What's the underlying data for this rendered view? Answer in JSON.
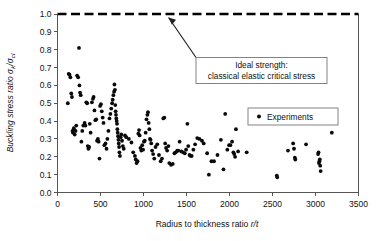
{
  "chart_data": {
    "type": "scatter",
    "title": "",
    "xlabel": "Radius to thickness ratio r/t",
    "ylabel": "Buckling stress ratio σk/σcl",
    "ylabel_parts": {
      "main": "Buckling stress ratio ",
      "sym1": "σ",
      "sub1": "k",
      "slash": "/",
      "sym2": "σ",
      "sub2": "cl"
    },
    "xlim": [
      0,
      3500
    ],
    "ylim": [
      0.0,
      1.0
    ],
    "xticks": [
      0,
      500,
      1000,
      1500,
      2000,
      2500,
      3000,
      3500
    ],
    "xtick_labels": [
      "0",
      "500",
      "1000",
      "1500",
      "2000",
      "2500",
      "3000",
      "3500"
    ],
    "yticks": [
      0.0,
      0.1,
      0.2,
      0.3,
      0.4,
      0.5,
      0.6,
      0.7,
      0.8,
      0.9,
      1.0
    ],
    "ytick_labels": [
      "0.0",
      "0.1",
      "0.2",
      "0.3",
      "0.4",
      "0.5",
      "0.6",
      "0.7",
      "0.8",
      "0.9",
      "1.0"
    ],
    "grid": false,
    "marker_color": "#0a0a0a",
    "marker_radius": 1.9,
    "reference_line": {
      "name": "ideal-strength-line",
      "y": 1.0,
      "style": "dashed",
      "color": "#000000"
    },
    "legend": {
      "position": "upper-right-inside",
      "entries": [
        {
          "label": "Experiments",
          "marker": "circle",
          "color": "#0a0a0a"
        }
      ]
    },
    "annotations": [
      {
        "name": "ideal-strength-annotation",
        "line1": "Ideal strength:",
        "line2": "classical elastic critical stress",
        "points_to": {
          "x": 1300,
          "y": 1.0
        }
      }
    ],
    "series": [
      {
        "name": "Experiments",
        "points": [
          [
            120,
            0.5
          ],
          [
            130,
            0.665
          ],
          [
            140,
            0.66
          ],
          [
            150,
            0.645
          ],
          [
            160,
            0.555
          ],
          [
            168,
            0.535
          ],
          [
            175,
            0.345
          ],
          [
            180,
            0.335
          ],
          [
            190,
            0.36
          ],
          [
            200,
            0.325
          ],
          [
            210,
            0.345
          ],
          [
            218,
            0.375
          ],
          [
            228,
            0.655
          ],
          [
            240,
            0.645
          ],
          [
            250,
            0.81
          ],
          [
            255,
            0.6
          ],
          [
            262,
            0.56
          ],
          [
            270,
            0.545
          ],
          [
            278,
            0.285
          ],
          [
            288,
            0.345
          ],
          [
            300,
            0.375
          ],
          [
            315,
            0.39
          ],
          [
            325,
            0.375
          ],
          [
            335,
            0.505
          ],
          [
            345,
            0.5
          ],
          [
            352,
            0.26
          ],
          [
            360,
            0.245
          ],
          [
            368,
            0.255
          ],
          [
            375,
            0.385
          ],
          [
            385,
            0.335
          ],
          [
            400,
            0.505
          ],
          [
            412,
            0.525
          ],
          [
            420,
            0.535
          ],
          [
            430,
            0.46
          ],
          [
            440,
            0.405
          ],
          [
            450,
            0.41
          ],
          [
            460,
            0.29
          ],
          [
            470,
            0.3
          ],
          [
            478,
            0.285
          ],
          [
            488,
            0.19
          ],
          [
            495,
            0.485
          ],
          [
            505,
            0.495
          ],
          [
            515,
            0.455
          ],
          [
            525,
            0.42
          ],
          [
            535,
            0.39
          ],
          [
            545,
            0.265
          ],
          [
            558,
            0.275
          ],
          [
            570,
            0.245
          ],
          [
            580,
            0.3
          ],
          [
            592,
            0.345
          ],
          [
            605,
            0.415
          ],
          [
            615,
            0.44
          ],
          [
            625,
            0.47
          ],
          [
            635,
            0.5
          ],
          [
            642,
            0.52
          ],
          [
            650,
            0.545
          ],
          [
            658,
            0.565
          ],
          [
            662,
            0.605
          ],
          [
            668,
            0.575
          ],
          [
            672,
            0.49
          ],
          [
            676,
            0.455
          ],
          [
            680,
            0.435
          ],
          [
            684,
            0.415
          ],
          [
            688,
            0.4
          ],
          [
            692,
            0.385
          ],
          [
            696,
            0.355
          ],
          [
            700,
            0.335
          ],
          [
            704,
            0.315
          ],
          [
            708,
            0.295
          ],
          [
            712,
            0.275
          ],
          [
            716,
            0.255
          ],
          [
            720,
            0.225
          ],
          [
            726,
            0.205
          ],
          [
            735,
            0.31
          ],
          [
            742,
            0.325
          ],
          [
            750,
            0.29
          ],
          [
            760,
            0.26
          ],
          [
            770,
            0.245
          ],
          [
            785,
            0.32
          ],
          [
            800,
            0.31
          ],
          [
            830,
            0.3
          ],
          [
            860,
            0.28
          ],
          [
            880,
            0.225
          ],
          [
            900,
            0.205
          ],
          [
            910,
            0.185
          ],
          [
            920,
            0.165
          ],
          [
            930,
            0.175
          ],
          [
            940,
            0.33
          ],
          [
            948,
            0.35
          ],
          [
            955,
            0.32
          ],
          [
            965,
            0.25
          ],
          [
            975,
            0.235
          ],
          [
            985,
            0.265
          ],
          [
            995,
            0.24
          ],
          [
            1005,
            0.285
          ],
          [
            1015,
            0.29
          ],
          [
            1025,
            0.335
          ],
          [
            1035,
            0.41
          ],
          [
            1045,
            0.435
          ],
          [
            1052,
            0.45
          ],
          [
            1060,
            0.39
          ],
          [
            1068,
            0.355
          ],
          [
            1075,
            0.3
          ],
          [
            1082,
            0.295
          ],
          [
            1090,
            0.275
          ],
          [
            1100,
            0.235
          ],
          [
            1112,
            0.215
          ],
          [
            1125,
            0.19
          ],
          [
            1140,
            0.255
          ],
          [
            1160,
            0.27
          ],
          [
            1180,
            0.21
          ],
          [
            1200,
            0.175
          ],
          [
            1215,
            0.19
          ],
          [
            1230,
            0.415
          ],
          [
            1242,
            0.42
          ],
          [
            1252,
            0.275
          ],
          [
            1262,
            0.25
          ],
          [
            1275,
            0.235
          ],
          [
            1290,
            0.26
          ],
          [
            1300,
            0.165
          ],
          [
            1320,
            0.155
          ],
          [
            1340,
            0.16
          ],
          [
            1360,
            0.22
          ],
          [
            1375,
            0.225
          ],
          [
            1392,
            0.235
          ],
          [
            1405,
            0.235
          ],
          [
            1420,
            0.285
          ],
          [
            1440,
            0.23
          ],
          [
            1460,
            0.225
          ],
          [
            1480,
            0.22
          ],
          [
            1495,
            0.24
          ],
          [
            1510,
            0.385
          ],
          [
            1520,
            0.26
          ],
          [
            1535,
            0.21
          ],
          [
            1548,
            0.205
          ],
          [
            1560,
            0.205
          ],
          [
            1580,
            0.24
          ],
          [
            1600,
            0.27
          ],
          [
            1625,
            0.305
          ],
          [
            1650,
            0.3
          ],
          [
            1680,
            0.29
          ],
          [
            1700,
            0.275
          ],
          [
            1740,
            0.22
          ],
          [
            1760,
            0.1
          ],
          [
            1790,
            0.175
          ],
          [
            1820,
            0.175
          ],
          [
            1860,
            0.21
          ],
          [
            1900,
            0.295
          ],
          [
            1930,
            0.13
          ],
          [
            1950,
            0.44
          ],
          [
            1975,
            0.24
          ],
          [
            1995,
            0.265
          ],
          [
            2010,
            0.265
          ],
          [
            2030,
            0.285
          ],
          [
            2045,
            0.225
          ],
          [
            2055,
            0.215
          ],
          [
            2065,
            0.2
          ],
          [
            2075,
            0.355
          ],
          [
            2100,
            0.23
          ],
          [
            2200,
            0.225
          ],
          [
            2550,
            0.095
          ],
          [
            2555,
            0.085
          ],
          [
            2680,
            0.235
          ],
          [
            2740,
            0.275
          ],
          [
            2750,
            0.245
          ],
          [
            2760,
            0.195
          ],
          [
            2765,
            0.185
          ],
          [
            2890,
            0.27
          ],
          [
            3030,
            0.215
          ],
          [
            3035,
            0.225
          ],
          [
            3040,
            0.165
          ],
          [
            3045,
            0.175
          ],
          [
            3050,
            0.185
          ],
          [
            3055,
            0.15
          ],
          [
            3060,
            0.12
          ],
          [
            3190,
            0.335
          ]
        ]
      }
    ]
  }
}
